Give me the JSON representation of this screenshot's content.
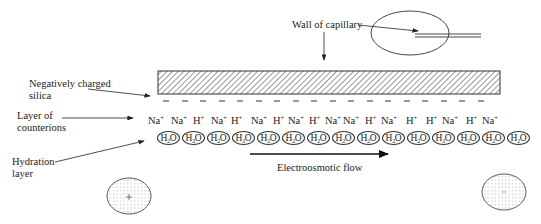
{
  "labels": {
    "wall_of_capillary": "Wall of capillary",
    "negatively_charged_line1": "Negatively charged",
    "negatively_charged_line2": "silica",
    "counterions_line1": "Layer of",
    "counterions_line2": "counterions",
    "hydration_line1": "Hydration",
    "hydration_line2": "layer",
    "flow": "Electroosmotic flow"
  },
  "surface_charges": {
    "symbol": "–",
    "count": 15
  },
  "counterions": [
    {
      "element": "Na",
      "charge": "+"
    },
    {
      "element": "Na",
      "charge": "+"
    },
    {
      "element": "H",
      "charge": "+"
    },
    {
      "element": "Na",
      "charge": "+"
    },
    {
      "element": "H",
      "charge": "+"
    },
    {
      "element": "Na",
      "charge": "+"
    },
    {
      "element": "H",
      "charge": "+"
    },
    {
      "element": "Na",
      "charge": "+"
    },
    {
      "element": "H",
      "charge": "+"
    },
    {
      "element": "Na",
      "charge": "+"
    },
    {
      "element": "Na",
      "charge": "+"
    },
    {
      "element": "H",
      "charge": "+"
    },
    {
      "element": "Na",
      "charge": "+"
    },
    {
      "element": "H",
      "charge": "+"
    },
    {
      "element": "H",
      "charge": "+"
    },
    {
      "element": "Na",
      "charge": "+"
    },
    {
      "element": "H",
      "charge": "+"
    },
    {
      "element": "Na",
      "charge": "+"
    }
  ],
  "hydration": {
    "molecule_prefix": "H",
    "molecule_subscript": "2",
    "molecule_suffix": "O",
    "count": 15
  },
  "colors": {
    "line": "#333333",
    "hatch": "#444444",
    "dots": "#9a9a9a"
  }
}
